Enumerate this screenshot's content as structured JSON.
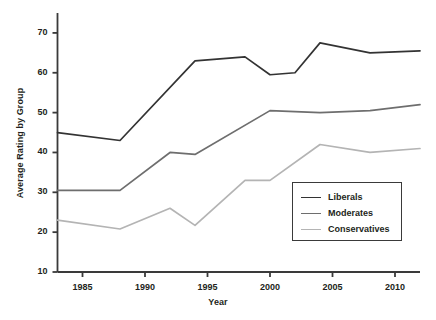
{
  "chart_data": {
    "type": "line",
    "title": "",
    "xlabel": "Year",
    "ylabel": "Average Rating by Group",
    "xlim": [
      1983,
      2012
    ],
    "ylim": [
      10,
      75
    ],
    "xticks": [
      1985,
      1990,
      1995,
      2000,
      2005,
      2010
    ],
    "yticks": [
      10,
      20,
      30,
      40,
      50,
      60,
      70
    ],
    "grid": false,
    "legend_position": "lower-right",
    "series": [
      {
        "name": "Liberals",
        "color": "#333333",
        "x": [
          1983,
          1988,
          1994,
          1998,
          2000,
          2002,
          2004,
          2008,
          2012
        ],
        "values": [
          45,
          43,
          63,
          64,
          59.5,
          60,
          67.5,
          65,
          65.5
        ]
      },
      {
        "name": "Moderates",
        "color": "#6e6e6e",
        "x": [
          1983,
          1988,
          1992,
          1994,
          2000,
          2004,
          2008,
          2012
        ],
        "values": [
          30.5,
          30.5,
          40,
          39.5,
          50.5,
          50,
          50.5,
          52
        ]
      },
      {
        "name": "Conservatives",
        "color": "#b4b4b4",
        "x": [
          1983,
          1988,
          1992,
          1994,
          1998,
          2000,
          2004,
          2008,
          2012
        ],
        "values": [
          23,
          20.8,
          26,
          21.7,
          33,
          33,
          42,
          40,
          41
        ]
      }
    ]
  },
  "legend": {
    "items": [
      {
        "label": "Liberals"
      },
      {
        "label": "Moderates"
      },
      {
        "label": "Conservatives"
      }
    ]
  },
  "axes": {
    "y_label": "Average Rating by Group",
    "x_label": "Year",
    "y_tick_labels": [
      "70",
      "60",
      "50",
      "40",
      "30",
      "20",
      "10"
    ],
    "x_tick_labels": [
      "1985",
      "1990",
      "1995",
      "2000",
      "2005",
      "2010"
    ]
  }
}
